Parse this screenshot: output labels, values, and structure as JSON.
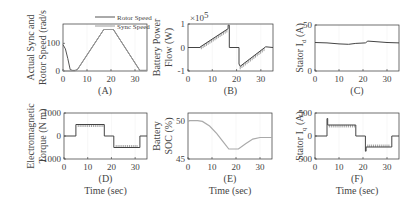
{
  "chart_data": [
    {
      "id": "A",
      "type": "line",
      "caption": "(A)",
      "ylabel_lines": [
        "Actual Sync and",
        "Rotor Speed (rad/s"
      ],
      "xlabel": "",
      "xlim": [
        0,
        35
      ],
      "ylim": [
        0,
        170
      ],
      "xticks": [
        0,
        10,
        20,
        30
      ],
      "yticks": [
        0,
        100
      ],
      "legend": [
        "Rotor Speed",
        "Sync Speed"
      ],
      "series": [
        {
          "name": "Rotor Speed",
          "color": "#555555",
          "x": [
            0,
            1,
            2,
            3,
            4,
            5,
            6,
            17,
            21,
            32,
            35
          ],
          "y": [
            95,
            80,
            45,
            5,
            2,
            2,
            5,
            150,
            150,
            2,
            2
          ]
        },
        {
          "name": "Sync Speed",
          "color": "#999999",
          "x": [
            0,
            4,
            5,
            6,
            17,
            21,
            32,
            35
          ],
          "y": [
            0,
            0,
            0,
            5,
            150,
            150,
            2,
            2
          ]
        }
      ]
    },
    {
      "id": "B",
      "type": "line",
      "caption": "(B)",
      "ylabel_lines": [
        "Battery Power",
        "Flow (W)"
      ],
      "multiplier": "×10^5",
      "xlim": [
        0,
        35
      ],
      "ylim": [
        -1,
        1
      ],
      "xticks": [
        0,
        10,
        20,
        30
      ],
      "yticks": [
        -1,
        0,
        1
      ],
      "series": [
        {
          "name": "Battery Power",
          "color": "#444444",
          "x": [
            0,
            5,
            5,
            16.5,
            16.5,
            17,
            17,
            21,
            21,
            21.5,
            32,
            35
          ],
          "y": [
            0,
            0,
            0.02,
            0.8,
            0.95,
            0.95,
            0,
            0,
            -0.7,
            -0.8,
            0.03,
            0
          ]
        }
      ]
    },
    {
      "id": "C",
      "type": "line",
      "caption": "(C)",
      "ylabel_lines": [
        "Stator I_d (A)"
      ],
      "xlim": [
        0,
        35
      ],
      "ylim": [
        0,
        50
      ],
      "xticks": [
        0,
        10,
        20,
        30
      ],
      "yticks": [
        0,
        50
      ],
      "series": [
        {
          "name": "Stator Id",
          "color": "#444444",
          "x": [
            0,
            5,
            10,
            14,
            17,
            21,
            22,
            25,
            30,
            35
          ],
          "y": [
            31,
            30.5,
            29.5,
            29,
            30,
            30.5,
            32.5,
            32,
            31,
            30.5
          ]
        }
      ]
    },
    {
      "id": "D",
      "type": "line",
      "caption": "(D)",
      "ylabel_lines": [
        "Electromagnetic",
        "Torque (N m)"
      ],
      "xlabel": "Time (sec)",
      "xlim": [
        0,
        35
      ],
      "ylim": [
        -1000,
        1000
      ],
      "xticks": [
        0,
        10,
        20,
        30
      ],
      "yticks": [
        -1000,
        0,
        1000
      ],
      "series": [
        {
          "name": "Torque",
          "color": "#444444",
          "x": [
            0,
            5,
            5,
            17,
            17,
            21,
            21,
            32,
            32,
            35
          ],
          "y": [
            0,
            0,
            500,
            500,
            0,
            0,
            -500,
            -500,
            0,
            0
          ]
        }
      ]
    },
    {
      "id": "E",
      "type": "line",
      "caption": "(E)",
      "ylabel_lines": [
        "Battery",
        "SOC (%)"
      ],
      "xlabel": "Time (sec)",
      "xlim": [
        0,
        35
      ],
      "ylim": [
        45,
        51
      ],
      "xticks": [
        0,
        10,
        20,
        30
      ],
      "yticks": [
        45,
        50
      ],
      "series": [
        {
          "name": "SOC",
          "color": "#aaaaaa",
          "x": [
            0,
            4,
            6,
            9,
            12,
            15,
            17,
            21,
            24,
            27,
            30,
            32,
            35
          ],
          "y": [
            50,
            50,
            49.9,
            49.3,
            48.3,
            47.1,
            46.3,
            46.3,
            47.0,
            47.6,
            47.8,
            47.8,
            47.8
          ]
        }
      ]
    },
    {
      "id": "F",
      "type": "line",
      "caption": "(F)",
      "ylabel_lines": [
        "Stator I_q (A)"
      ],
      "xlabel": "Time (sec)",
      "xlim": [
        0,
        35
      ],
      "ylim": [
        -500,
        500
      ],
      "xticks": [
        0,
        10,
        20,
        30
      ],
      "yticks": [
        -500,
        0,
        500
      ],
      "series": [
        {
          "name": "Stator Iq",
          "color": "#444444",
          "x": [
            0,
            5,
            5,
            5.3,
            5.3,
            17,
            17,
            21,
            21,
            21.3,
            21.3,
            32,
            32,
            35
          ],
          "y": [
            0,
            0,
            380,
            380,
            240,
            240,
            0,
            0,
            -330,
            -330,
            -240,
            -240,
            0,
            0
          ]
        }
      ]
    }
  ],
  "labels": {
    "time": "Time (sec)"
  }
}
